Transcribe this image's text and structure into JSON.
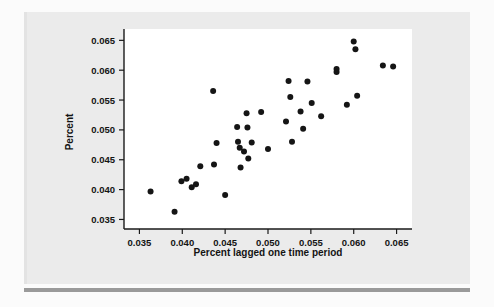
{
  "figure": {
    "background_color": "#ebebeb",
    "plot_background_color": "#ffffff",
    "point_color": "#151515",
    "axis_color": "#1a1a1a",
    "rule_color": "#9a9a9a"
  },
  "chart_data": {
    "type": "scatter",
    "title": "",
    "xlabel": "Percent lagged one time period",
    "ylabel": "Percent",
    "xlim": [
      0.0332,
      0.0668
    ],
    "ylim": [
      0.0334,
      0.0669
    ],
    "xticks": [
      0.035,
      0.04,
      0.045,
      0.05,
      0.055,
      0.06,
      0.065
    ],
    "yticks": [
      0.035,
      0.04,
      0.045,
      0.05,
      0.055,
      0.06,
      0.065
    ],
    "xticklabels": [
      "0.035",
      "0.040",
      "0.045",
      "0.050",
      "0.055",
      "0.060",
      "0.065"
    ],
    "yticklabels": [
      "0.035",
      "0.040",
      "0.045",
      "0.050",
      "0.055",
      "0.060",
      "0.065"
    ],
    "grid": false,
    "legend": false,
    "marker": "circle",
    "marker_size": 3.0,
    "n_points": 45,
    "points": [
      [
        0.0363,
        0.0397
      ],
      [
        0.0391,
        0.0363
      ],
      [
        0.0399,
        0.0414
      ],
      [
        0.0405,
        0.0418
      ],
      [
        0.0411,
        0.0404
      ],
      [
        0.0416,
        0.0409
      ],
      [
        0.0421,
        0.0439
      ],
      [
        0.0436,
        0.0565
      ],
      [
        0.0437,
        0.0442
      ],
      [
        0.044,
        0.0478
      ],
      [
        0.045,
        0.0391
      ],
      [
        0.0464,
        0.0505
      ],
      [
        0.0465,
        0.048
      ],
      [
        0.0467,
        0.047
      ],
      [
        0.0468,
        0.0437
      ],
      [
        0.0472,
        0.0464
      ],
      [
        0.0475,
        0.0528
      ],
      [
        0.0476,
        0.0504
      ],
      [
        0.0477,
        0.0452
      ],
      [
        0.0481,
        0.0479
      ],
      [
        0.0492,
        0.053
      ],
      [
        0.05,
        0.0468
      ],
      [
        0.0521,
        0.0514
      ],
      [
        0.0524,
        0.0582
      ],
      [
        0.0526,
        0.0555
      ],
      [
        0.0528,
        0.048
      ],
      [
        0.0538,
        0.0531
      ],
      [
        0.0541,
        0.0502
      ],
      [
        0.0546,
        0.0581
      ],
      [
        0.0551,
        0.0545
      ],
      [
        0.0562,
        0.0523
      ],
      [
        0.058,
        0.0602
      ],
      [
        0.058,
        0.0597
      ],
      [
        0.0592,
        0.0542
      ],
      [
        0.06,
        0.0648
      ],
      [
        0.0602,
        0.0635
      ],
      [
        0.0604,
        0.0557
      ],
      [
        0.0634,
        0.0608
      ],
      [
        0.0646,
        0.0606
      ]
    ]
  }
}
